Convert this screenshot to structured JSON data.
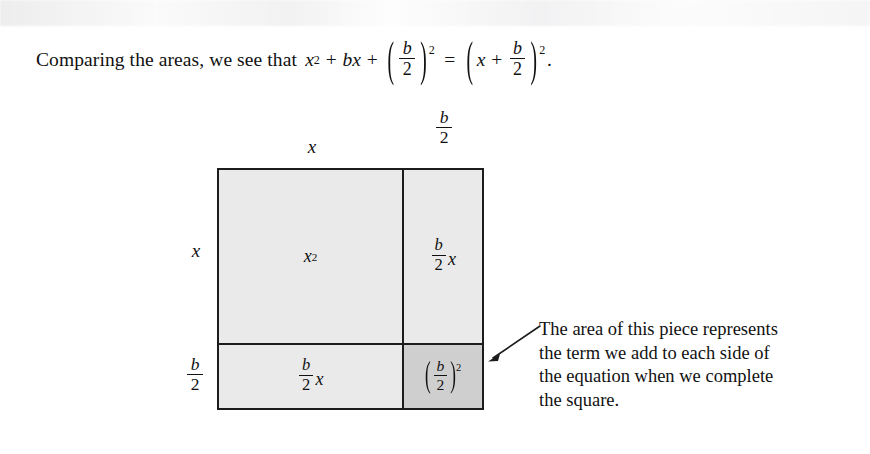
{
  "lead": {
    "text_before": "Comparing the areas, we see that",
    "equation": {
      "term1_base": "x",
      "term1_exp": "2",
      "plus1": "+",
      "term2_coef": "b",
      "term2_var": "x",
      "plus2": "+",
      "paren_open": "(",
      "frac_num": "b",
      "frac_den": "2",
      "paren_close": ")",
      "paren_exp": "2",
      "equals": "=",
      "rhs_paren_open": "(",
      "rhs_x": "x",
      "rhs_plus": "+",
      "rhs_frac_num": "b",
      "rhs_frac_den": "2",
      "rhs_paren_close": ")",
      "rhs_exp": "2",
      "period": "."
    },
    "plain": "Comparing the areas, we see that x^2 + bx + (b/2)^2 = (x + b/2)^2."
  },
  "figure": {
    "top_labels": [
      {
        "name": "x",
        "text": "x",
        "kind": "symbol"
      },
      {
        "name": "b-over-2",
        "num": "b",
        "den": "2",
        "kind": "fraction"
      }
    ],
    "left_labels": [
      {
        "name": "x",
        "text": "x",
        "kind": "symbol"
      },
      {
        "name": "b-over-2",
        "num": "b",
        "den": "2",
        "kind": "fraction"
      }
    ],
    "cells": [
      {
        "id": "x-squared",
        "position": "top-left",
        "label_plain": "x^2",
        "base": "x",
        "exponent": "2",
        "fill": "#eaeaea",
        "width_label": "x",
        "height_label": "x"
      },
      {
        "id": "b-over-2-times-x-top",
        "position": "top-right",
        "label_plain": "(b/2)x",
        "num": "b",
        "den": "2",
        "var": "x",
        "fill": "#eaeaea",
        "width_label": "b/2",
        "height_label": "x"
      },
      {
        "id": "b-over-2-times-x-bottom",
        "position": "bottom-left",
        "label_plain": "(b/2)x",
        "num": "b",
        "den": "2",
        "var": "x",
        "fill": "#eaeaea",
        "width_label": "x",
        "height_label": "b/2"
      },
      {
        "id": "b-over-2-squared",
        "position": "bottom-right",
        "label_plain": "(b/2)^2",
        "paren_open": "(",
        "num": "b",
        "den": "2",
        "paren_close": ")",
        "exponent": "2",
        "fill": "#cfcfcf",
        "width_label": "b/2",
        "height_label": "b/2",
        "highlighted": true
      }
    ],
    "border_color": "#1c1c1c"
  },
  "annotation": {
    "lines": [
      "The area of this piece represents",
      "the term we add to each side of",
      "the equation when we complete",
      "the square."
    ],
    "points_to": "b-over-2-squared",
    "arrow": "leader-arrow-left"
  },
  "colors": {
    "page_background": "#ffffff",
    "ink": "#111111",
    "cell_fill_light": "#eaeaea",
    "cell_fill_dark": "#cfcfcf",
    "rule": "#1c1c1c"
  }
}
